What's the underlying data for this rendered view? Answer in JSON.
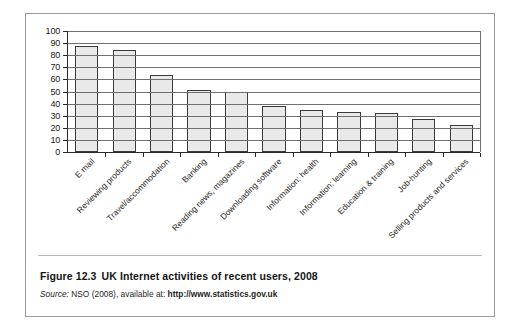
{
  "figure": {
    "caption_number": "Figure 12.3",
    "caption_text": "UK Internet activities of recent users, 2008",
    "source_label": "Source:",
    "source_text": "NSO (2008), available at:",
    "source_url": "http://www.statistics.gov.uk"
  },
  "chart_data": {
    "type": "bar",
    "title": "UK Internet activities of recent users, 2008",
    "xlabel": "",
    "ylabel": "",
    "ylim": [
      0,
      100
    ],
    "ytick_step": 10,
    "yticks": [
      0,
      10,
      20,
      30,
      40,
      50,
      60,
      70,
      80,
      90,
      100
    ],
    "grid": true,
    "legend": null,
    "bar_fill": "#e9e9e9",
    "bar_edge": "#3a3a3a",
    "categories": [
      "E mail",
      "Reviewing products",
      "Travel/accommodation",
      "Banking",
      "Reading news, magazines",
      "Downloading software",
      "Information: health",
      "Information: learning",
      "Education & training",
      "Job-hunting",
      "Selling products and services"
    ],
    "values": [
      88,
      84,
      64,
      51,
      50,
      38,
      35,
      33,
      32,
      27,
      22
    ]
  }
}
